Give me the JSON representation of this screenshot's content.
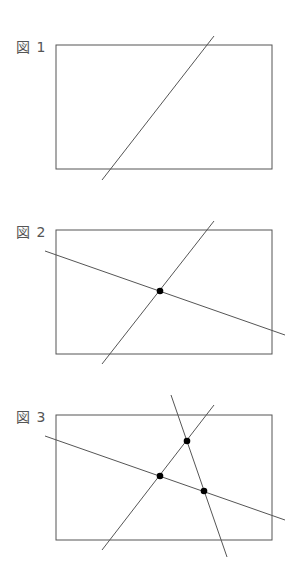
{
  "figures": [
    {
      "label": "図 1",
      "label_pos": [
        16,
        44
      ],
      "rect": {
        "x": 56,
        "y": 45,
        "w": 216,
        "h": 124
      },
      "lines": [
        [
          214,
          36,
          102,
          180
        ]
      ],
      "points": []
    },
    {
      "label": "図 2",
      "label_pos": [
        16,
        229
      ],
      "rect": {
        "x": 56,
        "y": 230,
        "w": 216,
        "h": 124
      },
      "lines": [
        [
          214,
          221,
          102,
          364
        ],
        [
          45,
          251,
          285,
          335
        ]
      ],
      "points": [
        [
          160,
          291
        ]
      ]
    },
    {
      "label": "図 3",
      "label_pos": [
        16,
        414
      ],
      "rect": {
        "x": 56,
        "y": 415,
        "w": 216,
        "h": 125
      },
      "lines": [
        [
          214,
          405,
          102,
          550
        ],
        [
          45,
          436,
          285,
          520
        ],
        [
          171,
          395,
          227,
          557
        ]
      ],
      "points": [
        [
          160,
          476
        ],
        [
          187,
          441
        ],
        [
          204,
          491
        ]
      ]
    }
  ],
  "colors": {
    "stroke": "#555555",
    "point": "#000000"
  }
}
